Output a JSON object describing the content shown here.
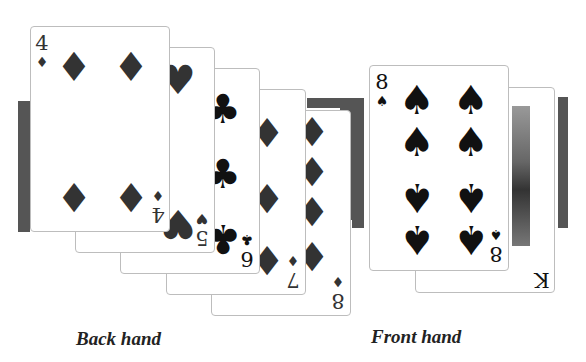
{
  "back_hand": {
    "caption": "Back hand",
    "cards": [
      {
        "rank": "4",
        "suit": "♦",
        "suit_name": "diamonds"
      },
      {
        "rank": "5",
        "suit": "♥",
        "suit_name": "hearts"
      },
      {
        "rank": "6",
        "suit": "♣",
        "suit_name": "clubs"
      },
      {
        "rank": "7",
        "suit": "♦",
        "suit_name": "diamonds"
      },
      {
        "rank": "8",
        "suit": "♦",
        "suit_name": "diamonds"
      }
    ]
  },
  "front_hand": {
    "caption": "Front hand",
    "cards": [
      {
        "rank": "8",
        "suit": "♠",
        "suit_name": "spades"
      },
      {
        "rank": "K",
        "suit": "♠",
        "suit_name": "spades"
      }
    ]
  },
  "colors": {
    "bar": "#555555",
    "pip_dark": "#333333",
    "pip_black": "#111111"
  }
}
